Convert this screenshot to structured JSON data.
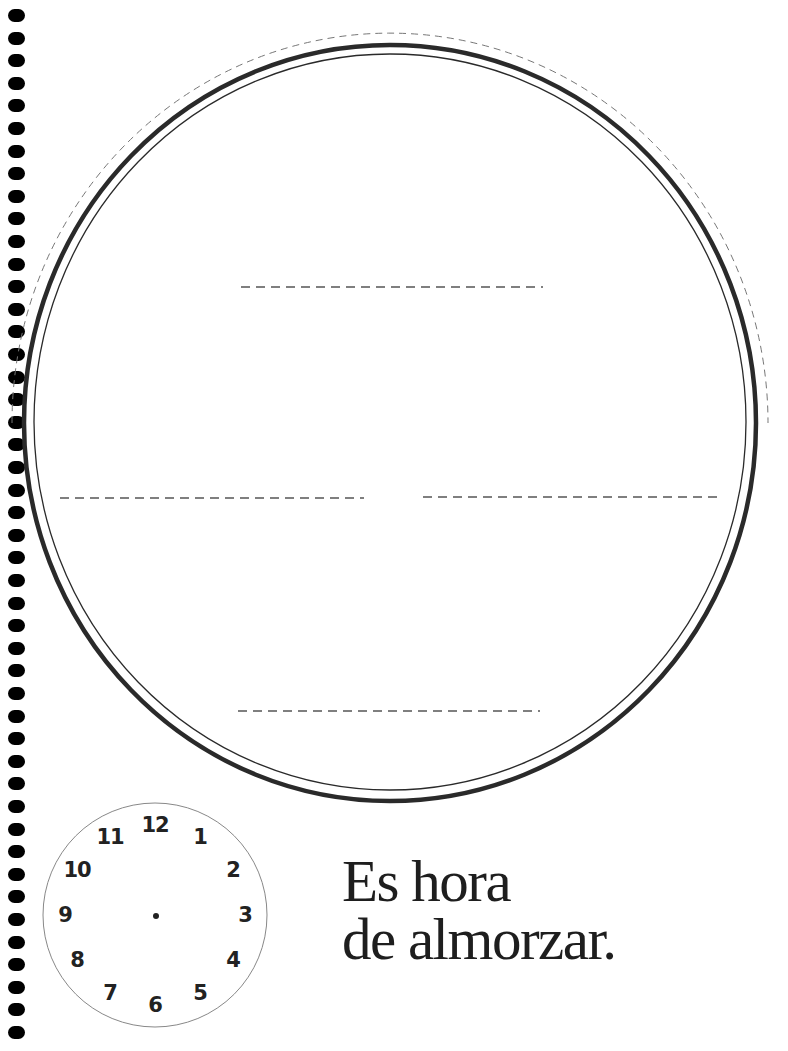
{
  "worksheet": {
    "caption": {
      "line1": "Es hora",
      "line2": "de almorzar."
    },
    "plate": {
      "answer_lines": [
        {
          "position": "top"
        },
        {
          "position": "left"
        },
        {
          "position": "right"
        },
        {
          "position": "bottom"
        }
      ]
    },
    "clock": {
      "numbers": [
        "12",
        "1",
        "2",
        "3",
        "4",
        "5",
        "6",
        "7",
        "8",
        "9",
        "10",
        "11"
      ],
      "hands": "none"
    },
    "spiral_binding": {
      "hole_count": 46
    },
    "colors": {
      "ink": "#1e1e1e",
      "dashed_line": "#666666",
      "background": "#ffffff"
    }
  }
}
